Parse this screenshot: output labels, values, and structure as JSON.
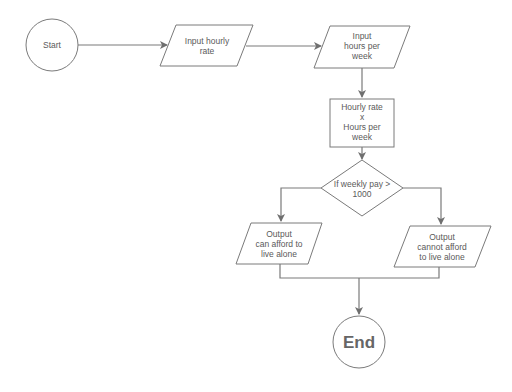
{
  "diagram": {
    "type": "flowchart",
    "colors": {
      "stroke": "#7a7a7a",
      "text": "#5a5a5a",
      "background": "#ffffff"
    },
    "nodes": {
      "start": {
        "shape": "circle",
        "label": "Start"
      },
      "input_rate": {
        "shape": "parallelogram",
        "line1": "Input hourly",
        "line2": "rate"
      },
      "input_hours": {
        "shape": "parallelogram",
        "line1": "Input",
        "line2": "hours per",
        "line3": "week"
      },
      "compute": {
        "shape": "rectangle",
        "line1": "Hourly rate",
        "line2": "x",
        "line3": "Hours per",
        "line4": "week"
      },
      "decision": {
        "shape": "diamond",
        "line1": "If weekly pay >",
        "line2": "1000"
      },
      "output_yes": {
        "shape": "parallelogram",
        "line1": "Output",
        "line2": "can afford to",
        "line3": "live alone"
      },
      "output_no": {
        "shape": "parallelogram",
        "line1": "Output",
        "line2": "cannot afford",
        "line3": "to live alone"
      },
      "end": {
        "shape": "circle",
        "label": "End"
      }
    },
    "edges": [
      {
        "from": "start",
        "to": "input_rate"
      },
      {
        "from": "input_rate",
        "to": "input_hours"
      },
      {
        "from": "input_hours",
        "to": "compute"
      },
      {
        "from": "compute",
        "to": "decision"
      },
      {
        "from": "decision",
        "to": "output_yes"
      },
      {
        "from": "decision",
        "to": "output_no"
      },
      {
        "from": "output_yes",
        "to": "end"
      },
      {
        "from": "output_no",
        "to": "end"
      }
    ]
  }
}
